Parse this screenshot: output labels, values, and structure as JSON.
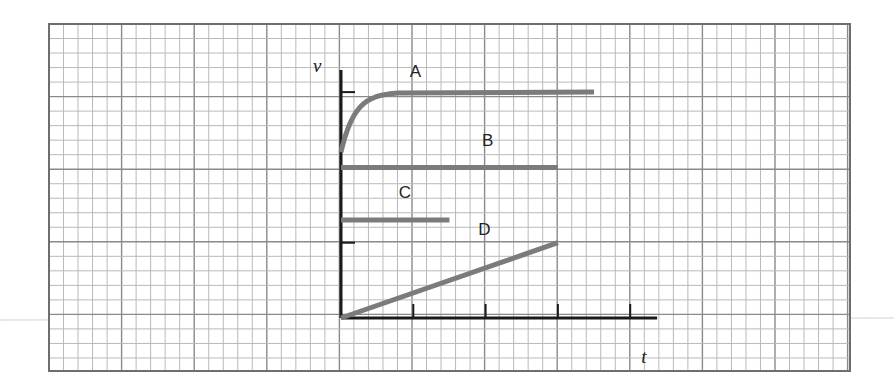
{
  "chart_data": {
    "type": "line",
    "title": "",
    "xlabel": "t",
    "ylabel": "v",
    "x_ticks": [
      1,
      2,
      3,
      4
    ],
    "y_ticks": [
      1,
      2,
      3
    ],
    "xlim": [
      0,
      4.4
    ],
    "ylim": [
      0,
      3.4
    ],
    "grid": true,
    "series": [
      {
        "name": "A",
        "label": "A",
        "shape": "exponential-approach",
        "start_v": 2.2,
        "final_v": 3.0,
        "settle_t": 0.8,
        "t_end": 3.5
      },
      {
        "name": "B",
        "label": "B",
        "shape": "constant",
        "v": 2.0,
        "t_end": 3.0
      },
      {
        "name": "C",
        "label": "C",
        "shape": "constant",
        "v": 1.3,
        "t_end": 1.5
      },
      {
        "name": "D",
        "label": "D",
        "shape": "linear",
        "points": [
          [
            0,
            0
          ],
          [
            3.0,
            1.0
          ]
        ]
      }
    ]
  },
  "colors": {
    "grid_minor": "#b9b9b9",
    "grid_major": "#8a8a8a",
    "axis": "#1a1a1a",
    "curve": "#7b7b7b"
  }
}
